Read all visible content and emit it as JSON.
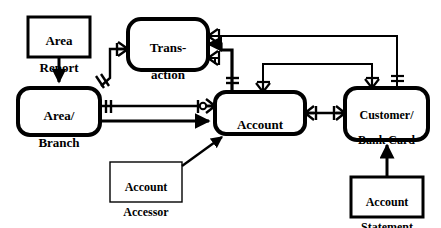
{
  "diagram": {
    "type": "entity-relationship",
    "stroke_color": "#000000",
    "fill_color": "#ffffff",
    "background": "#ffffff",
    "entities": [
      {
        "id": "area-report",
        "label": "Area\nReport",
        "line1": "Area",
        "line2": "Report",
        "shape": "rectangle",
        "border": "thick",
        "x": 28,
        "y": 17,
        "w": 62,
        "h": 40
      },
      {
        "id": "transaction",
        "label": "Trans-\naction",
        "line1": "Trans-",
        "line2": "action",
        "shape": "rounded-rectangle",
        "border": "thick",
        "x": 128,
        "y": 19,
        "w": 80,
        "h": 51
      },
      {
        "id": "area-branch",
        "label": "Area/\nBranch",
        "line1": "Area/",
        "line2": "Branch",
        "shape": "rounded-rectangle",
        "border": "thick",
        "x": 18,
        "y": 88,
        "w": 82,
        "h": 47
      },
      {
        "id": "account",
        "label": "Account",
        "line1": "Account",
        "line2": "",
        "shape": "rounded-rectangle",
        "border": "thick",
        "x": 215,
        "y": 92,
        "w": 90,
        "h": 42
      },
      {
        "id": "customer-bank-card",
        "label": "Customer/\nBank Card",
        "line1": "Customer/",
        "line2": "Bank Card",
        "shape": "rounded-rectangle",
        "border": "thick",
        "x": 345,
        "y": 88,
        "w": 83,
        "h": 52
      },
      {
        "id": "account-accessor",
        "label": "Account\nAccessor",
        "line1": "Account",
        "line2": "Accessor",
        "shape": "rectangle",
        "border": "thin",
        "x": 110,
        "y": 162,
        "w": 72,
        "h": 40
      },
      {
        "id": "account-statement",
        "label": "Account\nStatement",
        "line1": "Account",
        "line2": "Statement",
        "shape": "rectangle",
        "border": "thick",
        "x": 351,
        "y": 177,
        "w": 72,
        "h": 40
      }
    ],
    "relationships": [
      {
        "id": "rel-area-report-to-area-branch",
        "from": "area-report",
        "to": "area-branch",
        "style": "solid-arrow"
      },
      {
        "id": "rel-area-branch-to-transaction",
        "from": "area-branch",
        "to": "transaction",
        "style": "crowsfoot-many-to-one"
      },
      {
        "id": "rel-area-branch-to-account-top",
        "from": "area-branch",
        "to": "account",
        "style": "one-to-zero-or-many"
      },
      {
        "id": "rel-area-branch-to-account-bottom",
        "from": "area-branch",
        "to": "account",
        "style": "solid-arrow"
      },
      {
        "id": "rel-account-to-transaction",
        "from": "account",
        "to": "transaction",
        "style": "crowsfoot-many"
      },
      {
        "id": "rel-customer-to-transaction",
        "from": "customer-bank-card",
        "to": "transaction",
        "style": "crowsfoot-many"
      },
      {
        "id": "rel-account-to-customer",
        "from": "account",
        "to": "customer-bank-card",
        "style": "one-to-one"
      },
      {
        "id": "rel-account-accessor-to-account",
        "from": "account-accessor",
        "to": "account",
        "style": "solid-arrow"
      },
      {
        "id": "rel-account-statement-to-customer",
        "from": "account-statement",
        "to": "customer-bank-card",
        "style": "solid-arrow"
      }
    ]
  }
}
